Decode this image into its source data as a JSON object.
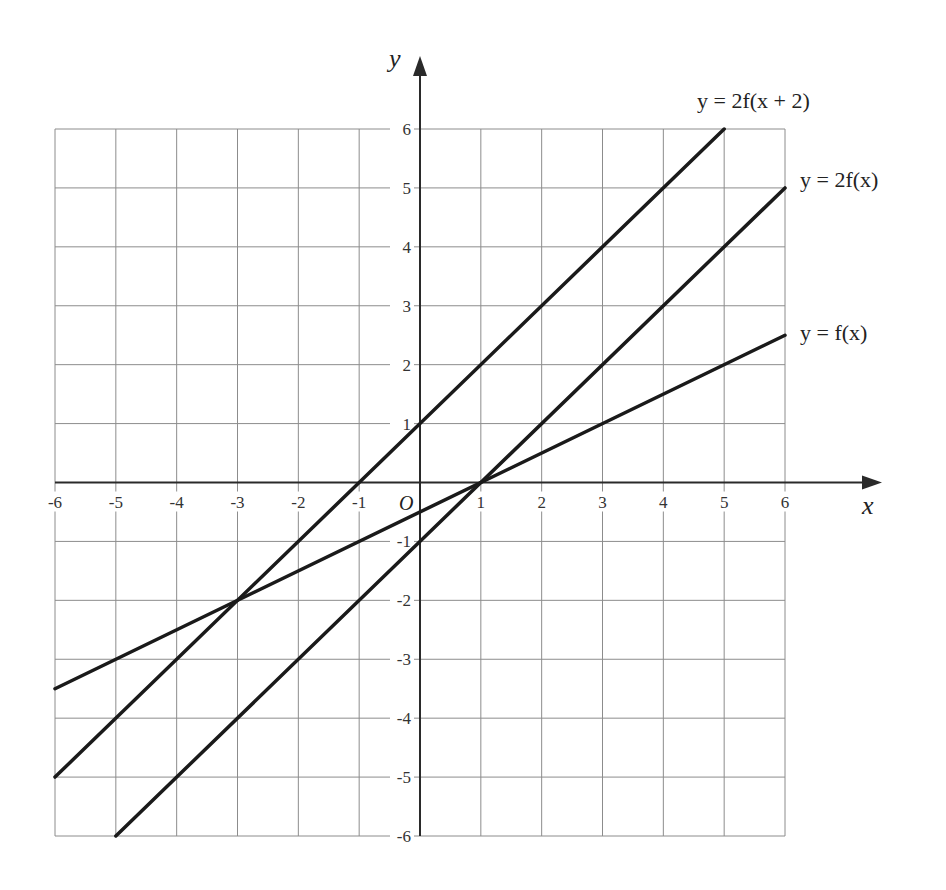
{
  "chart_data": {
    "type": "line",
    "title": "",
    "xlabel": "x",
    "ylabel": "y",
    "origin_label": "O",
    "xlim": [
      -6,
      6
    ],
    "ylim": [
      -6,
      6
    ],
    "grid": true,
    "x_ticks": [
      -6,
      -5,
      -4,
      -3,
      -2,
      -1,
      1,
      2,
      3,
      4,
      5,
      6
    ],
    "y_ticks": [
      6,
      5,
      4,
      3,
      2,
      1,
      -1,
      -2,
      -3,
      -4,
      -5,
      -6
    ],
    "series": [
      {
        "name": "y = f(x)",
        "equation": "y = (x - 1)/2",
        "points": [
          [
            -6,
            -3.5
          ],
          [
            6,
            2.5
          ]
        ],
        "color": "#1a1a1a"
      },
      {
        "name": "y = 2f(x)",
        "equation": "y = x - 1",
        "points": [
          [
            -5,
            -6
          ],
          [
            6,
            5
          ]
        ],
        "color": "#1a1a1a"
      },
      {
        "name": "y = 2f(x + 2)",
        "equation": "y = x + 1",
        "points": [
          [
            -6,
            -5
          ],
          [
            5,
            6
          ]
        ],
        "color": "#1a1a1a"
      }
    ],
    "annotations": [
      {
        "text": "y = 2f(x + 2)",
        "near": [
          5,
          6
        ]
      },
      {
        "text": "y = 2f(x)",
        "near": [
          6,
          5
        ]
      },
      {
        "text": "y = f(x)",
        "near": [
          6,
          2.5
        ]
      }
    ]
  },
  "labels": {
    "x_axis": "x",
    "y_axis": "y",
    "origin": "O",
    "curve_2f_x_plus_2": "y = 2f(x + 2)",
    "curve_2f_x": "y = 2f(x)",
    "curve_f_x": "y = f(x)"
  },
  "colors": {
    "grid": "#8c8c8c",
    "axis": "#2a2a2a",
    "line": "#1a1a1a",
    "text": "#333333"
  }
}
